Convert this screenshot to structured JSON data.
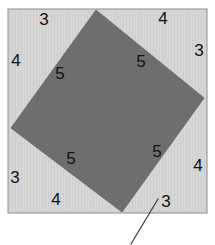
{
  "figure": {
    "outer_square": {
      "name": "outer-square-frame",
      "x": 8,
      "y": 9,
      "width": 199,
      "height": 204,
      "fill_color": "#d6d6d6",
      "stroke_color": "#8d8d8d",
      "stroke_width": 1
    },
    "inner_square": {
      "name": "inscribed-tilted-square",
      "fill_color": "#6e6e6e",
      "stroke_color": "#6e6e6e",
      "vertices": [
        {
          "label": "top",
          "x": 96,
          "y": 10
        },
        {
          "label": "right",
          "x": 204,
          "y": 98
        },
        {
          "label": "bottom",
          "x": 122,
          "y": 212
        },
        {
          "label": "left",
          "x": 11,
          "y": 128
        }
      ]
    },
    "leader_line": {
      "name": "leader-line",
      "x1": 158,
      "y1": 199,
      "x2": 131,
      "y2": 244,
      "stroke_color": "#3a3a3a",
      "stroke_width": 1.2
    },
    "labels": [
      {
        "name": "label-top-left-leg-3",
        "text": "3",
        "x": 44,
        "y": 21,
        "region": "top-left-triangle",
        "side": "leg-a",
        "on_dark": false
      },
      {
        "name": "label-top-right-leg-4",
        "text": "4",
        "x": 163,
        "y": 20,
        "region": "top-right-triangle",
        "side": "leg-b",
        "on_dark": false
      },
      {
        "name": "label-left-leg-4",
        "text": "4",
        "x": 16,
        "y": 62,
        "region": "top-left-triangle",
        "side": "leg-b",
        "on_dark": false
      },
      {
        "name": "label-right-leg-3",
        "text": "3",
        "x": 199,
        "y": 52,
        "region": "top-right-triangle",
        "side": "leg-a",
        "on_dark": false
      },
      {
        "name": "label-top-left-hyp-5",
        "text": "5",
        "x": 60,
        "y": 75,
        "region": "top-left-triangle",
        "side": "hypotenuse",
        "on_dark": true
      },
      {
        "name": "label-top-right-hyp-5",
        "text": "5",
        "x": 141,
        "y": 63,
        "region": "top-right-triangle",
        "side": "hypotenuse",
        "on_dark": true
      },
      {
        "name": "label-bot-right-hyp-5",
        "text": "5",
        "x": 157,
        "y": 153,
        "region": "bottom-right-triangle",
        "side": "hypotenuse",
        "on_dark": true
      },
      {
        "name": "label-bot-left-hyp-5",
        "text": "5",
        "x": 71,
        "y": 160,
        "region": "bottom-left-triangle",
        "side": "hypotenuse",
        "on_dark": true
      },
      {
        "name": "label-left-low-3",
        "text": "3",
        "x": 15,
        "y": 179,
        "region": "bottom-left-triangle",
        "side": "leg-a",
        "on_dark": false
      },
      {
        "name": "label-right-low-4",
        "text": "4",
        "x": 198,
        "y": 167,
        "region": "bottom-right-triangle",
        "side": "leg-b",
        "on_dark": false
      },
      {
        "name": "label-bottom-left-4",
        "text": "4",
        "x": 56,
        "y": 201,
        "region": "bottom-left-triangle",
        "side": "leg-b",
        "on_dark": false
      },
      {
        "name": "label-bottom-right-3",
        "text": "3",
        "x": 166,
        "y": 203,
        "region": "bottom-right-triangle",
        "side": "leg-a",
        "on_dark": false
      }
    ]
  }
}
